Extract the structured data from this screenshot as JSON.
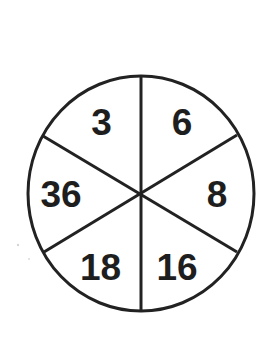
{
  "puzzle": {
    "type": "number-wheel",
    "segments": [
      {
        "position": "top-left",
        "value": "3"
      },
      {
        "position": "top-right",
        "value": "6"
      },
      {
        "position": "right",
        "value": "8"
      },
      {
        "position": "bottom-right",
        "value": "16"
      },
      {
        "position": "bottom-left",
        "value": "18"
      },
      {
        "position": "left",
        "value": "36"
      }
    ],
    "segment_count": 6
  },
  "colors": {
    "line": "#222222",
    "text": "#1e1e1e",
    "background": "#ffffff"
  }
}
